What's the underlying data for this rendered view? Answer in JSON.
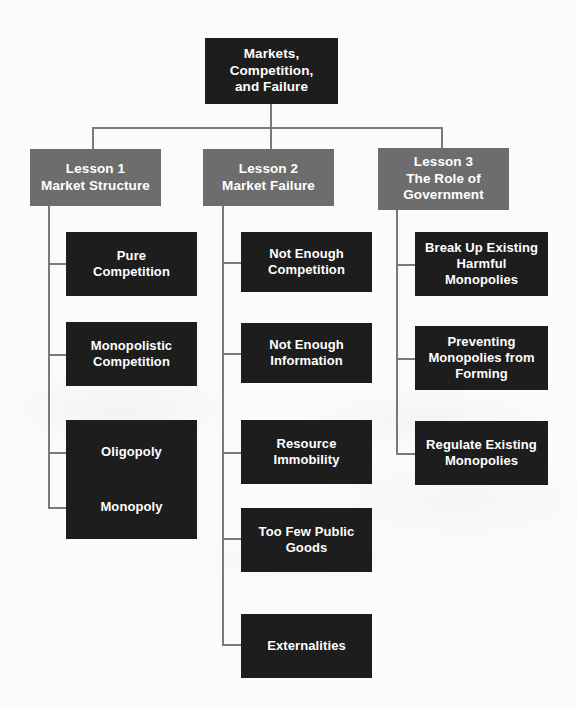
{
  "diagram": {
    "title": "Markets, Competition, and Failure",
    "type": "organizational-tree",
    "colors": {
      "node_dark": "#1d1d1d",
      "node_gray": "#6d6d6d",
      "connector": "#7a7a7a",
      "background": "#fbfbfa",
      "text": "#ffffff"
    },
    "root": {
      "label": "Markets,\nCompetition,\nand Failure"
    },
    "branches": [
      {
        "label": "Lesson 1\nMarket Structure",
        "children": [
          {
            "label": "Pure\nCompetition"
          },
          {
            "label": "Monopolistic\nCompetition"
          },
          {
            "label": "Oligopoly"
          },
          {
            "label": "Monopoly"
          }
        ]
      },
      {
        "label": "Lesson 2\nMarket Failure",
        "children": [
          {
            "label": "Not Enough\nCompetition"
          },
          {
            "label": "Not Enough\nInformation"
          },
          {
            "label": "Resource\nImmobility"
          },
          {
            "label": "Too Few Public\nGoods"
          },
          {
            "label": "Externalities"
          }
        ]
      },
      {
        "label": "Lesson 3\nThe Role of\nGovernment",
        "children": [
          {
            "label": "Break Up Existing\nHarmful\nMonopolies"
          },
          {
            "label": "Preventing\nMonopolies from\nForming"
          },
          {
            "label": "Regulate Existing\nMonopolies"
          }
        ]
      }
    ]
  }
}
